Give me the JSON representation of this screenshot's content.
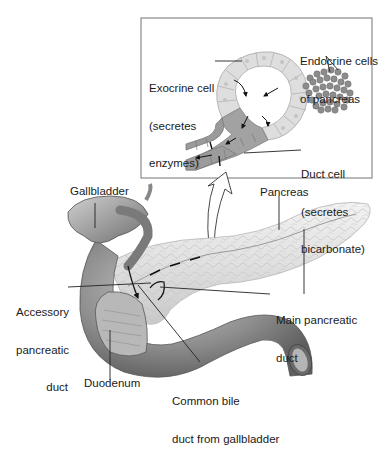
{
  "diagram": {
    "inset": {
      "labels": {
        "exocrine": [
          "Exocrine cell",
          "(secretes",
          "enzymes)"
        ],
        "endocrine": [
          "Endocrine cells",
          "of pancreas"
        ],
        "duct_cell": [
          "Duct cell",
          "(secretes",
          "bicarbonate)"
        ]
      }
    },
    "main": {
      "labels": {
        "gallbladder": "Gallbladder",
        "pancreas": "Pancreas",
        "accessory_duct": [
          "Accessory",
          "pancreatic",
          "duct"
        ],
        "main_duct": [
          "Main pancreatic",
          "duct"
        ],
        "duodenum": "Duodenum",
        "common_bile_duct": [
          "Common bile",
          "duct from gallbladder"
        ]
      }
    },
    "colors": {
      "background": "#ffffff",
      "inset_border": "#8a8a8a",
      "exocrine_cell": "#dcdcdc",
      "duct_cell": "#9a9a9a",
      "endocrine_cell": "#8c8c8c",
      "pancreas": "#e6e6e6",
      "duodenum": "#8e8e8e",
      "gallbladder": "#9c9c9c",
      "leader_line": "#222222"
    }
  }
}
